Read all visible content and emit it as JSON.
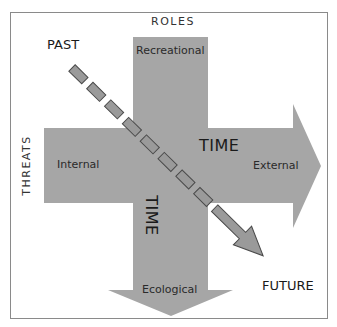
{
  "diagram": {
    "axes": {
      "vertical_title": "ROLES",
      "horizontal_title": "THREATS"
    },
    "vertical_arrow": {
      "top_label": "Recreational",
      "bottom_label": "Ecological",
      "axis_label": "TIME"
    },
    "horizontal_arrow": {
      "left_label": "Internal",
      "right_label": "External",
      "axis_label": "TIME"
    },
    "timeline": {
      "start_label": "PAST",
      "end_label": "FUTURE"
    },
    "colors": {
      "arrow_fill": "#a6a6a6",
      "dash_fill": "#9a9a9a",
      "dash_stroke": "#4a4a4a",
      "frame": "#8a8a8a",
      "text": "#222222"
    }
  }
}
